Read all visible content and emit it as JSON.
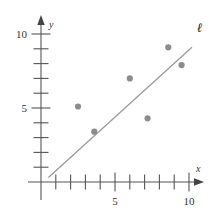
{
  "chart_data": {
    "type": "scatter",
    "title": "",
    "subtitle": "",
    "xlabel": "x",
    "ylabel": "y",
    "xlim": [
      -0.6,
      11.8
    ],
    "ylim": [
      -0.6,
      11.5
    ],
    "grid": false,
    "legend_position": "none",
    "x_ticks": [
      1,
      2,
      3,
      4,
      5,
      6,
      7,
      8,
      9,
      10,
      11
    ],
    "x_tick_labels": [
      "",
      "",
      "",
      "",
      "5",
      "",
      "",
      "",
      "",
      "10",
      ""
    ],
    "y_ticks": [
      1,
      2,
      3,
      4,
      5,
      6,
      7,
      8,
      9,
      10
    ],
    "y_tick_labels": [
      "",
      "",
      "",
      "",
      "5",
      "",
      "",
      "",
      "",
      "10"
    ],
    "x_labeled_ticks": [
      {
        "value": 5,
        "label": "5"
      },
      {
        "value": 10,
        "label": "10"
      }
    ],
    "y_labeled_ticks": [
      {
        "value": 5,
        "label": "5"
      },
      {
        "value": 10,
        "label": "10"
      }
    ],
    "series": [
      {
        "name": "data points",
        "type": "scatter",
        "marker": "circle",
        "color": "#8c8c8c",
        "points": [
          {
            "x": 2.5,
            "y": 5.1
          },
          {
            "x": 3.6,
            "y": 3.4
          },
          {
            "x": 6.0,
            "y": 7.0
          },
          {
            "x": 7.2,
            "y": 4.3
          },
          {
            "x": 8.6,
            "y": 9.1
          },
          {
            "x": 9.5,
            "y": 7.9
          }
        ]
      },
      {
        "name": "l",
        "type": "line",
        "color": "#9a9a9a",
        "label": "ℓ",
        "endpoints": [
          {
            "x": 0.5,
            "y": 0.3
          },
          {
            "x": 10.2,
            "y": 9.1
          }
        ],
        "slope": 0.907,
        "intercept": -0.154
      }
    ],
    "annotations": [
      {
        "text": "ℓ",
        "x": 10.6,
        "y": 10.2,
        "name": "line-label-l"
      }
    ]
  },
  "axes": {
    "x_axis_name": "x",
    "y_axis_name": "y",
    "axis_color": "#555555",
    "tick_color": "#555555"
  }
}
